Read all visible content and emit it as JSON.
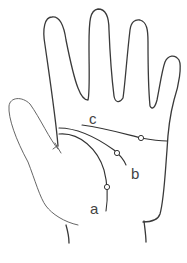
{
  "diagram": {
    "labels": {
      "a": "a",
      "b": "b",
      "c": "c"
    },
    "colors": {
      "background": "#ffffff",
      "stroke": "#3a3a3a"
    }
  }
}
